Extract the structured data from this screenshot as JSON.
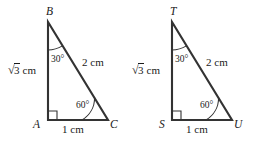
{
  "figure": {
    "background_color": "#ffffff",
    "line_color": "#333333",
    "text_color": "#1a1a1a",
    "triangles": [
      {
        "id": "triangle-abc",
        "vertices": {
          "apex": {
            "name": "B",
            "x": 48,
            "y": 22
          },
          "right_angle": {
            "name": "A",
            "x": 48,
            "y": 120
          },
          "base_right": {
            "name": "C",
            "x": 108,
            "y": 120
          }
        },
        "angles": {
          "apex_label": "30°",
          "base_right_label": "60°",
          "right_angle_label": "90°"
        },
        "sides": {
          "vertical_leg": {
            "radical_sign": "√",
            "radicand": "3",
            "unit": "cm"
          },
          "hypotenuse": "2 cm",
          "horizontal_leg": "1 cm"
        }
      },
      {
        "id": "triangle-tsu",
        "vertices": {
          "apex": {
            "name": "T",
            "x": 172,
            "y": 22
          },
          "right_angle": {
            "name": "S",
            "x": 172,
            "y": 120
          },
          "base_right": {
            "name": "U",
            "x": 232,
            "y": 120
          }
        },
        "angles": {
          "apex_label": "30°",
          "base_right_label": "60°",
          "right_angle_label": "90°"
        },
        "sides": {
          "vertical_leg": {
            "radical_sign": "√",
            "radicand": "3",
            "unit": "cm"
          },
          "hypotenuse": "2 cm",
          "horizontal_leg": "1 cm"
        }
      }
    ]
  }
}
